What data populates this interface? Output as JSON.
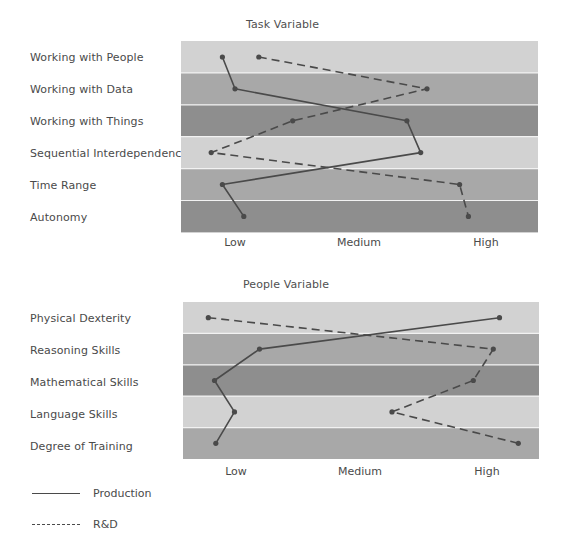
{
  "chart_data": [
    {
      "type": "line",
      "title": "Task Variable",
      "orientation": "horizontal-profile",
      "categories": [
        "Working with People",
        "Working with Data",
        "Working with Things",
        "Sequential Interdependence",
        "Time Range",
        "Autonomy"
      ],
      "x_ticks": [
        "Low",
        "Medium",
        "High"
      ],
      "x_scale": {
        "Low": 1,
        "Medium": 2,
        "High": 3
      },
      "xlim": [
        0.63,
        3.47
      ],
      "grid": false,
      "band_colors": [
        "#d2d2d2",
        "#a8a8a8",
        "#8e8e8e",
        "#d2d2d2",
        "#a8a8a8",
        "#8e8e8e"
      ],
      "series": [
        {
          "name": "Production",
          "style": "solid",
          "values": [
            0.9,
            1.0,
            2.37,
            2.48,
            0.9,
            1.07
          ]
        },
        {
          "name": "R&D",
          "style": "dashed",
          "values": [
            1.19,
            2.53,
            1.46,
            0.81,
            2.79,
            2.86
          ]
        }
      ]
    },
    {
      "type": "line",
      "title": "People Variable",
      "orientation": "horizontal-profile",
      "categories": [
        "Physical Dexterity",
        "Reasoning Skills",
        "Mathematical Skills",
        "Language Skills",
        "Degree of Training"
      ],
      "x_ticks": [
        "Low",
        "Medium",
        "High"
      ],
      "x_scale": {
        "Low": 1,
        "Medium": 2,
        "High": 3
      },
      "xlim": [
        0.63,
        3.47
      ],
      "grid": false,
      "band_colors": [
        "#d2d2d2",
        "#a8a8a8",
        "#8e8e8e",
        "#d2d2d2",
        "#a8a8a8"
      ],
      "series": [
        {
          "name": "Production",
          "style": "solid",
          "values": [
            3.1,
            1.18,
            0.82,
            0.98,
            0.83
          ]
        },
        {
          "name": "R&D",
          "style": "dashed",
          "values": [
            0.77,
            3.05,
            2.89,
            2.24,
            3.25
          ]
        }
      ]
    }
  ],
  "legend": {
    "items": [
      {
        "label": "Production",
        "style": "solid"
      },
      {
        "label": "R&D",
        "style": "dashed"
      }
    ],
    "position": "bottom-left"
  },
  "colors": {
    "line": "#4a4a4a",
    "text": "#4a4a4a"
  }
}
